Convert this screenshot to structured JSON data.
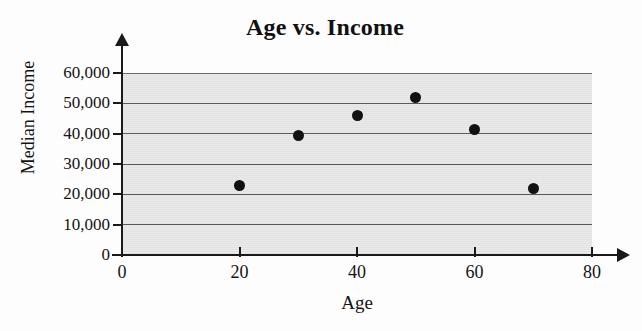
{
  "chart_data": {
    "type": "scatter",
    "title": "Age vs. Income",
    "xlabel": "Age",
    "ylabel": "Median Income",
    "xlim": [
      0,
      80
    ],
    "ylim": [
      0,
      60000
    ],
    "grid": true,
    "legend": null,
    "x_ticks": [
      {
        "value": 0,
        "label": "0"
      },
      {
        "value": 20,
        "label": "20"
      },
      {
        "value": 40,
        "label": "40"
      },
      {
        "value": 60,
        "label": "60"
      },
      {
        "value": 80,
        "label": "80"
      }
    ],
    "y_ticks": [
      {
        "value": 0,
        "label": "0"
      },
      {
        "value": 10000,
        "label": "10,000"
      },
      {
        "value": 20000,
        "label": "20,000"
      },
      {
        "value": 30000,
        "label": "30,000"
      },
      {
        "value": 40000,
        "label": "40,000"
      },
      {
        "value": 50000,
        "label": "50,000"
      },
      {
        "value": 60000,
        "label": "60,000"
      }
    ],
    "points": [
      {
        "x": 20,
        "y": 23000
      },
      {
        "x": 30,
        "y": 39500
      },
      {
        "x": 40,
        "y": 46000
      },
      {
        "x": 50,
        "y": 52000
      },
      {
        "x": 60,
        "y": 41500
      },
      {
        "x": 70,
        "y": 22000
      }
    ],
    "colors": {
      "point": "#111111",
      "plot_background": "#e6e6e6",
      "gridline": "#5a5a5a",
      "axis": "#1a1a1a",
      "text": "#141414",
      "page_background": "#fdfdfd"
    }
  }
}
